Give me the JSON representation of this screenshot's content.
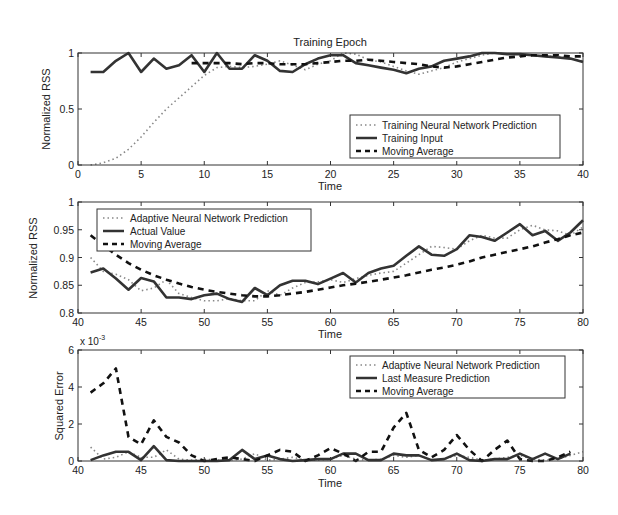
{
  "chart_data": [
    {
      "type": "line",
      "title": "Training Epoch",
      "xlabel": "Time",
      "ylabel": "Normalized RSS",
      "xlim": [
        0,
        40
      ],
      "ylim": [
        0,
        1
      ],
      "xticks": [
        0,
        5,
        10,
        15,
        20,
        25,
        30,
        35,
        40
      ],
      "yticks": [
        0,
        0.5,
        1
      ],
      "ytick_labels": [
        "0",
        "0.5",
        "1"
      ],
      "grid": false,
      "legend_position": "lower right",
      "series": [
        {
          "name": "Training Neural Network Prediction",
          "style": "dotted",
          "x": [
            1,
            2,
            3,
            4,
            5,
            6,
            7,
            8,
            9,
            10,
            11,
            12,
            13,
            14,
            15,
            16,
            17,
            18,
            19,
            20,
            21,
            22,
            23,
            24,
            25,
            26,
            27,
            28,
            29,
            30,
            31,
            32,
            33,
            34,
            35,
            36,
            37,
            38,
            39,
            40
          ],
          "values": [
            0.0,
            0.02,
            0.06,
            0.14,
            0.25,
            0.38,
            0.5,
            0.6,
            0.7,
            0.8,
            0.87,
            0.88,
            0.87,
            0.88,
            0.9,
            0.93,
            0.89,
            0.85,
            0.9,
            0.93,
            1.0,
            0.99,
            0.94,
            0.92,
            0.88,
            0.84,
            0.81,
            0.84,
            0.87,
            0.92,
            0.95,
            0.98,
            1.0,
            0.99,
            0.99,
            0.98,
            0.97,
            0.97,
            0.95,
            0.93
          ]
        },
        {
          "name": "Training Input",
          "style": "solid",
          "x": [
            1,
            2,
            3,
            4,
            5,
            6,
            7,
            8,
            9,
            10,
            11,
            12,
            13,
            14,
            15,
            16,
            17,
            18,
            19,
            20,
            21,
            22,
            23,
            24,
            25,
            26,
            27,
            28,
            29,
            30,
            31,
            32,
            33,
            34,
            35,
            36,
            37,
            38,
            39,
            40
          ],
          "values": [
            0.83,
            0.83,
            0.93,
            1.0,
            0.83,
            0.95,
            0.86,
            0.89,
            0.98,
            0.83,
            1.0,
            0.86,
            0.86,
            0.98,
            0.93,
            0.84,
            0.83,
            0.9,
            0.95,
            0.98,
            0.98,
            0.91,
            0.89,
            0.87,
            0.85,
            0.82,
            0.86,
            0.88,
            0.93,
            0.95,
            0.97,
            1.0,
            1.0,
            0.99,
            0.99,
            0.98,
            0.97,
            0.96,
            0.95,
            0.92
          ]
        },
        {
          "name": "Moving Average",
          "style": "dashed",
          "x": [
            9,
            10,
            11,
            12,
            13,
            14,
            15,
            16,
            17,
            18,
            19,
            20,
            21,
            22,
            23,
            24,
            25,
            26,
            27,
            28,
            29,
            30,
            31,
            32,
            33,
            34,
            35,
            36,
            37,
            38,
            39,
            40
          ],
          "values": [
            0.91,
            0.91,
            0.91,
            0.91,
            0.9,
            0.91,
            0.91,
            0.9,
            0.9,
            0.9,
            0.91,
            0.92,
            0.93,
            0.93,
            0.94,
            0.93,
            0.92,
            0.91,
            0.9,
            0.88,
            0.87,
            0.88,
            0.9,
            0.92,
            0.94,
            0.96,
            0.97,
            0.98,
            0.98,
            0.98,
            0.97,
            0.97
          ]
        }
      ]
    },
    {
      "type": "line",
      "title": "",
      "xlabel": "Time",
      "ylabel": "Normalized RSS",
      "xlim": [
        40,
        80
      ],
      "ylim": [
        0.8,
        1
      ],
      "xticks": [
        40,
        45,
        50,
        55,
        60,
        65,
        70,
        75,
        80
      ],
      "yticks": [
        0.8,
        0.85,
        0.9,
        0.95,
        1
      ],
      "ytick_labels": [
        "0.8",
        "0.85",
        "0.9",
        "0.95",
        "1"
      ],
      "grid": false,
      "legend_position": "upper left",
      "series": [
        {
          "name": "Adaptive Neural Network Prediction",
          "style": "dotted",
          "x": [
            41,
            42,
            43,
            44,
            45,
            46,
            47,
            48,
            49,
            50,
            51,
            52,
            53,
            54,
            55,
            56,
            57,
            58,
            59,
            60,
            61,
            62,
            63,
            64,
            65,
            66,
            67,
            68,
            69,
            70,
            71,
            72,
            73,
            74,
            75,
            76,
            77,
            78,
            79,
            80
          ],
          "values": [
            0.9,
            0.875,
            0.87,
            0.86,
            0.84,
            0.845,
            0.86,
            0.835,
            0.828,
            0.822,
            0.822,
            0.826,
            0.822,
            0.822,
            0.84,
            0.832,
            0.845,
            0.855,
            0.856,
            0.86,
            0.855,
            0.862,
            0.868,
            0.872,
            0.875,
            0.89,
            0.905,
            0.92,
            0.918,
            0.915,
            0.93,
            0.94,
            0.935,
            0.935,
            0.95,
            0.958,
            0.95,
            0.948,
            0.94,
            0.955
          ]
        },
        {
          "name": "Actual Value",
          "style": "solid",
          "x": [
            41,
            42,
            43,
            44,
            45,
            46,
            47,
            48,
            49,
            50,
            51,
            52,
            53,
            54,
            55,
            56,
            57,
            58,
            59,
            60,
            61,
            62,
            63,
            64,
            65,
            66,
            67,
            68,
            69,
            70,
            71,
            72,
            73,
            74,
            75,
            76,
            77,
            78,
            79,
            80
          ],
          "values": [
            0.873,
            0.88,
            0.862,
            0.842,
            0.863,
            0.857,
            0.828,
            0.828,
            0.825,
            0.832,
            0.835,
            0.825,
            0.82,
            0.845,
            0.832,
            0.85,
            0.858,
            0.858,
            0.852,
            0.862,
            0.872,
            0.855,
            0.872,
            0.88,
            0.885,
            0.903,
            0.92,
            0.905,
            0.903,
            0.915,
            0.94,
            0.937,
            0.93,
            0.945,
            0.96,
            0.94,
            0.948,
            0.93,
            0.945,
            0.967
          ]
        },
        {
          "name": "Moving Average",
          "style": "dashed",
          "x": [
            41,
            42,
            43,
            44,
            45,
            46,
            47,
            48,
            49,
            50,
            51,
            52,
            53,
            54,
            55,
            56,
            57,
            58,
            59,
            60,
            61,
            62,
            63,
            64,
            65,
            66,
            67,
            68,
            69,
            70,
            71,
            72,
            73,
            74,
            75,
            76,
            77,
            78,
            79,
            80
          ],
          "values": [
            0.94,
            0.922,
            0.905,
            0.89,
            0.878,
            0.868,
            0.86,
            0.853,
            0.847,
            0.842,
            0.838,
            0.835,
            0.832,
            0.83,
            0.83,
            0.832,
            0.835,
            0.838,
            0.842,
            0.846,
            0.85,
            0.853,
            0.856,
            0.86,
            0.864,
            0.868,
            0.873,
            0.878,
            0.882,
            0.887,
            0.893,
            0.9,
            0.905,
            0.91,
            0.915,
            0.92,
            0.927,
            0.933,
            0.94,
            0.945
          ]
        }
      ]
    },
    {
      "type": "line",
      "title": "",
      "xlabel": "Time",
      "ylabel": "Squared Error",
      "y_multiplier": "x 10^-3",
      "xlim": [
        40,
        80
      ],
      "ylim": [
        0,
        6
      ],
      "xticks": [
        40,
        45,
        50,
        55,
        60,
        65,
        70,
        75,
        80
      ],
      "yticks": [
        0,
        2,
        4,
        6
      ],
      "ytick_labels": [
        "0",
        "2",
        "4",
        "6"
      ],
      "grid": false,
      "legend_position": "upper right",
      "series": [
        {
          "name": "Adaptive Neural Network Prediction",
          "style": "dotted",
          "x": [
            41,
            42,
            43,
            44,
            45,
            46,
            47,
            48,
            49,
            50,
            51,
            52,
            53,
            54,
            55,
            56,
            57,
            58,
            59,
            60,
            61,
            62,
            63,
            64,
            65,
            66,
            67,
            68,
            69,
            70,
            71,
            72,
            73,
            74,
            75,
            76,
            77,
            78,
            79,
            80
          ],
          "values": [
            0.75,
            0.1,
            0.2,
            0.5,
            0.2,
            0.2,
            0.6,
            0.1,
            0.05,
            0.1,
            0.05,
            0.05,
            0.1,
            0.4,
            0.05,
            0.1,
            0.2,
            0.05,
            0.05,
            0.1,
            0.3,
            0.1,
            0.05,
            0.1,
            0.3,
            0.2,
            0.3,
            0.05,
            0.1,
            0.3,
            0.2,
            0.05,
            0.1,
            0.2,
            0.3,
            0.1,
            0.05,
            0.1,
            0.3,
            0.5
          ]
        },
        {
          "name": "Last Measure Prediction",
          "style": "solid",
          "x": [
            41,
            42,
            43,
            44,
            45,
            46,
            47,
            48,
            49,
            50,
            51,
            52,
            53,
            54,
            55,
            56,
            57,
            58,
            59,
            60,
            61,
            62,
            63,
            64,
            65,
            66,
            67,
            68,
            69,
            70,
            71,
            72,
            73,
            74,
            75,
            76,
            77,
            78,
            79
          ],
          "values": [
            0.05,
            0.3,
            0.5,
            0.5,
            0.05,
            0.8,
            0.05,
            0.0,
            0.0,
            0.0,
            0.0,
            0.05,
            0.6,
            0.1,
            0.3,
            0.1,
            0.0,
            0.05,
            0.1,
            0.1,
            0.4,
            0.4,
            0.05,
            0.05,
            0.4,
            0.3,
            0.3,
            0.05,
            0.1,
            0.4,
            0.05,
            0.0,
            0.1,
            0.1,
            0.4,
            0.1,
            0.4,
            0.1,
            0.4
          ]
        },
        {
          "name": "Moving Average",
          "style": "dashed",
          "x": [
            41,
            42,
            43,
            44,
            45,
            46,
            47,
            48,
            49,
            50,
            51,
            52,
            53,
            54,
            55,
            56,
            57,
            58,
            59,
            60,
            61,
            62,
            63,
            64,
            65,
            66,
            67,
            68,
            69,
            70,
            71,
            72,
            73,
            74,
            75,
            76,
            77,
            78,
            79
          ],
          "values": [
            3.7,
            4.2,
            5.0,
            1.3,
            0.9,
            2.2,
            1.3,
            1.0,
            0.3,
            0.0,
            0.1,
            0.2,
            0.1,
            0.0,
            0.3,
            0.6,
            0.5,
            0.0,
            0.3,
            0.7,
            0.4,
            0.0,
            0.5,
            0.5,
            1.8,
            2.6,
            0.6,
            0.2,
            0.6,
            1.4,
            0.6,
            0.0,
            0.6,
            1.1,
            0.1,
            0.0,
            0.0,
            0.2,
            0.5
          ]
        }
      ]
    }
  ],
  "figure": {
    "title": "Training Epoch",
    "panels": [
      {
        "xlabel": "Time",
        "ylabel": "Normalized RSS",
        "xtick_labels": [
          "0",
          "5",
          "10",
          "15",
          "20",
          "25",
          "30",
          "35",
          "40"
        ],
        "legend": [
          "Training Neural Network Prediction",
          "Training Input",
          "Moving Average"
        ]
      },
      {
        "xlabel": "Time",
        "ylabel": "Normalized RSS",
        "xtick_labels": [
          "40",
          "45",
          "50",
          "55",
          "60",
          "65",
          "70",
          "75",
          "80"
        ],
        "legend": [
          "Adaptive Neural Network Prediction",
          "Actual Value",
          "Moving Average"
        ]
      },
      {
        "xlabel": "Time",
        "ylabel": "Squared Error",
        "multiplier_base": "x 10",
        "multiplier_exp": "-3",
        "xtick_labels": [
          "40",
          "45",
          "50",
          "55",
          "60",
          "65",
          "70",
          "75",
          "80"
        ],
        "legend": [
          "Adaptive Neural Network Prediction",
          "Last Measure Prediction",
          "Moving Average"
        ]
      }
    ]
  }
}
